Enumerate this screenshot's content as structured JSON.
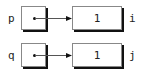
{
  "diagram": {
    "type": "pointer-diagram",
    "rows": [
      {
        "pointer_label": "p",
        "target_value": "1",
        "target_label": "i"
      },
      {
        "pointer_label": "q",
        "target_value": "1",
        "target_label": "j"
      }
    ],
    "colors": {
      "stroke": "#888888",
      "shadow": "#111111",
      "text": "#222222"
    }
  }
}
